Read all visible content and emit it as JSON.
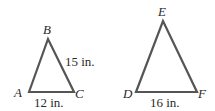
{
  "diagram": {
    "line_color": "#555555",
    "triangles": [
      {
        "name": "ABC",
        "vertices": {
          "A": {
            "label": "A",
            "x": 29,
            "y": 92
          },
          "B": {
            "label": "B",
            "x": 48,
            "y": 39
          },
          "C": {
            "label": "C",
            "x": 74,
            "y": 92
          }
        },
        "sides": {
          "BC": "15 in.",
          "AC": "12 in."
        }
      },
      {
        "name": "DEF",
        "vertices": {
          "D": {
            "label": "D",
            "x": 136,
            "y": 92
          },
          "E": {
            "label": "E",
            "x": 163,
            "y": 21
          },
          "F": {
            "label": "F",
            "x": 197,
            "y": 92
          }
        },
        "sides": {
          "DF": "16 in."
        }
      }
    ]
  }
}
